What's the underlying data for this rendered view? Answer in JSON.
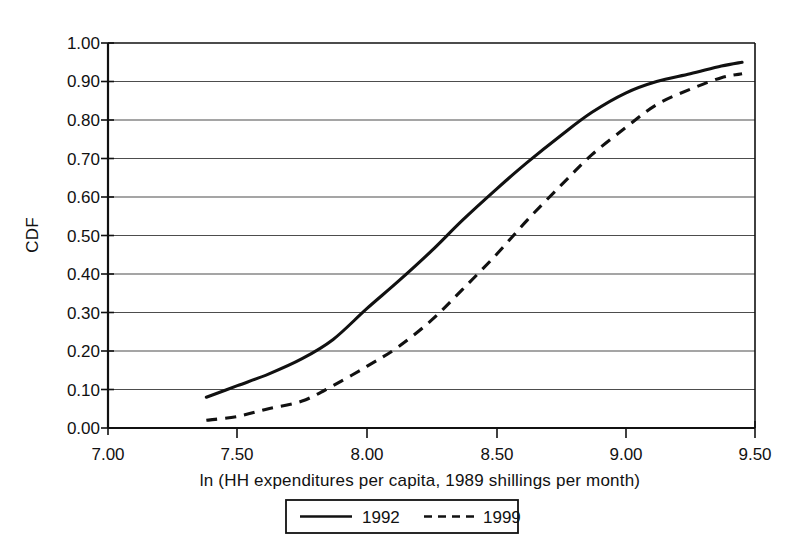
{
  "chart_data": {
    "type": "line",
    "title": "",
    "xlabel": "ln (HH expenditures per capita, 1989 shillings per month)",
    "ylabel": "CDF",
    "xlim": [
      7.0,
      9.5
    ],
    "ylim": [
      0.0,
      1.0
    ],
    "grid": "horizontal",
    "legend_position": "below-axis",
    "xticks": [
      "7.00",
      "7.50",
      "8.00",
      "8.50",
      "9.00",
      "9.50"
    ],
    "xtick_values": [
      7.0,
      7.5,
      8.0,
      8.5,
      9.0,
      9.5
    ],
    "yticks": [
      "0.00",
      "0.10",
      "0.20",
      "0.30",
      "0.40",
      "0.50",
      "0.60",
      "0.70",
      "0.80",
      "0.90",
      "1.00"
    ],
    "ytick_values": [
      0.0,
      0.1,
      0.2,
      0.3,
      0.4,
      0.5,
      0.6,
      0.7,
      0.8,
      0.9,
      1.0
    ],
    "series": [
      {
        "name": "1992",
        "style": "solid",
        "color": "#111111",
        "x": [
          7.38,
          7.5,
          7.62,
          7.75,
          7.87,
          8.0,
          8.12,
          8.25,
          8.37,
          8.5,
          8.62,
          8.75,
          8.87,
          9.0,
          9.12,
          9.25,
          9.37,
          9.45
        ],
        "values": [
          0.08,
          0.11,
          0.14,
          0.18,
          0.23,
          0.31,
          0.38,
          0.46,
          0.54,
          0.62,
          0.69,
          0.76,
          0.82,
          0.87,
          0.9,
          0.92,
          0.94,
          0.95
        ]
      },
      {
        "name": "1999",
        "style": "dashed",
        "color": "#111111",
        "x": [
          7.38,
          7.5,
          7.62,
          7.75,
          7.87,
          8.0,
          8.12,
          8.25,
          8.37,
          8.5,
          8.62,
          8.75,
          8.87,
          9.0,
          9.12,
          9.25,
          9.37,
          9.45
        ],
        "values": [
          0.02,
          0.03,
          0.05,
          0.07,
          0.11,
          0.16,
          0.21,
          0.28,
          0.36,
          0.45,
          0.54,
          0.63,
          0.71,
          0.78,
          0.84,
          0.88,
          0.91,
          0.92
        ]
      }
    ]
  },
  "axes": {
    "y_title": "CDF",
    "x_title": "ln (HH expenditures per capita, 1989 shillings per month)",
    "x_tick_labels": [
      "7.00",
      "7.50",
      "8.00",
      "8.50",
      "9.00",
      "9.50"
    ],
    "y_tick_labels": [
      "1.00",
      "0.90",
      "0.80",
      "0.70",
      "0.60",
      "0.50",
      "0.40",
      "0.30",
      "0.20",
      "0.10",
      "0.00"
    ]
  },
  "legend": {
    "entries": [
      {
        "label": "1992",
        "style": "solid"
      },
      {
        "label": "1999",
        "style": "dashed"
      }
    ]
  }
}
